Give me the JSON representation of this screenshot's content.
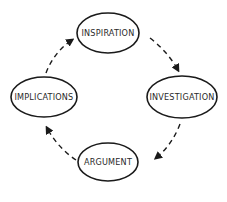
{
  "diagram": {
    "type": "cycle",
    "colors": {
      "stroke": "#1a1a1a",
      "text": "#2a2a2a",
      "background": "#ffffff"
    },
    "nodes": [
      {
        "id": "inspiration",
        "label": "INSPIRATION"
      },
      {
        "id": "investigation",
        "label": "INVESTIGATION"
      },
      {
        "id": "argument",
        "label": "ARGUMENT"
      },
      {
        "id": "implications",
        "label": "IMPLICATIONS"
      }
    ],
    "edges": [
      {
        "from": "inspiration",
        "to": "investigation",
        "style": "dashed-arrow"
      },
      {
        "from": "investigation",
        "to": "argument",
        "style": "dashed-arrow"
      },
      {
        "from": "argument",
        "to": "implications",
        "style": "dashed-arrow"
      },
      {
        "from": "implications",
        "to": "inspiration",
        "style": "dashed-arrow"
      }
    ]
  }
}
